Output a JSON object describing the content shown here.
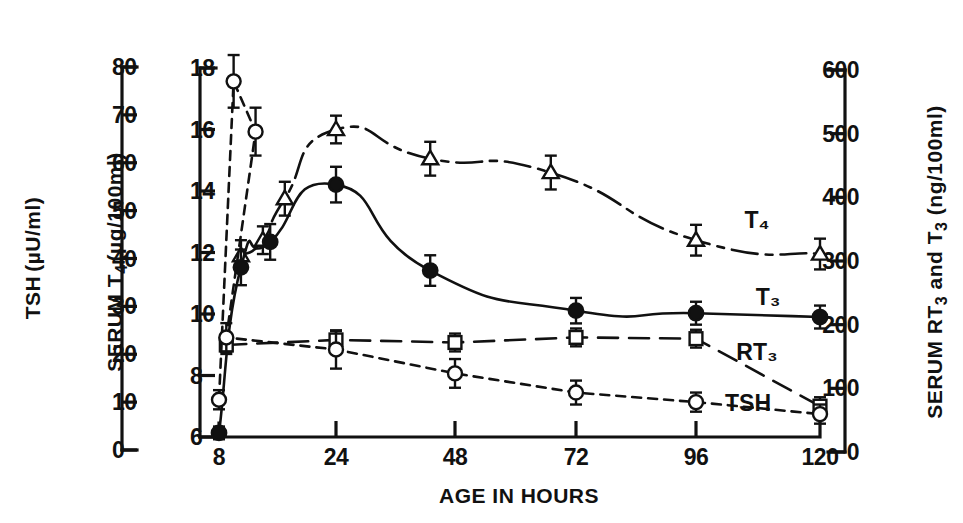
{
  "figure": {
    "background": "#ffffff",
    "ink": "#111111"
  },
  "axes": {
    "x": {
      "title": "AGE IN HOURS",
      "ticks": [
        "8",
        "24",
        "48",
        "72",
        "96",
        "120"
      ],
      "values": [
        8,
        24,
        48,
        72,
        96,
        120
      ]
    },
    "y_far_left": {
      "title_main": "TSH",
      "title_units": "(µU/ml)",
      "ticks": [
        "0",
        "10",
        "20",
        "30",
        "40",
        "50",
        "60",
        "70",
        "80"
      ],
      "values": [
        0,
        10,
        20,
        30,
        40,
        50,
        60,
        70,
        80
      ]
    },
    "y_left": {
      "title_main": "SERUM T",
      "title_sub": "4",
      "title_units": "(µg/100ml)",
      "ticks": [
        "6",
        "8",
        "10",
        "12",
        "14",
        "16",
        "18"
      ],
      "values": [
        6,
        8,
        10,
        12,
        14,
        16,
        18
      ]
    },
    "y_right": {
      "title_main": "SERUM RT",
      "title_sub1": "3",
      "title_mid": " and T",
      "title_sub2": "3",
      "title_units": " (ng/100ml)",
      "ticks": [
        "0",
        "100",
        "200",
        "300",
        "400",
        "500",
        "600"
      ],
      "values": [
        0,
        100,
        200,
        300,
        400,
        500,
        600
      ]
    }
  },
  "chart_data": {
    "type": "line",
    "title": "",
    "xlabel": "AGE IN HOURS",
    "ylabel": "SERUM T4 (µg/100ml) / TSH (µU/ml) / SERUM RT3 and T3 (ng/100ml)",
    "xlim": [
      8,
      120
    ],
    "xticks": [
      8,
      24,
      48,
      72,
      96,
      120
    ],
    "grid": false,
    "legend": "inline-right-end",
    "axis_note": "x spacing 8-24 equals spacing 24-48 (compressed early interval)",
    "series": [
      {
        "name": "T4",
        "label": "T₄",
        "marker": "open-triangle",
        "line": "dash-dot",
        "axis": "y_left",
        "units": "µg/100ml",
        "points": [
          {
            "x": 11,
            "y": 11.9,
            "err": 0.5
          },
          {
            "x": 14,
            "y": 12.4,
            "err": 0.45
          },
          {
            "x": 17,
            "y": 13.75,
            "err": 0.55
          },
          {
            "x": 24,
            "y": 16.0,
            "err": 0.45
          },
          {
            "x": 43,
            "y": 15.05,
            "err": 0.55
          },
          {
            "x": 67,
            "y": 14.6,
            "err": 0.55
          },
          {
            "x": 96,
            "y": 12.4,
            "err": 0.5
          },
          {
            "x": 120,
            "y": 11.95,
            "err": 0.5
          }
        ]
      },
      {
        "name": "T3",
        "label": "T₃",
        "marker": "filled-circle",
        "line": "solid",
        "axis": "y_right",
        "units": "ng/100ml",
        "points": [
          {
            "x": 8,
            "y": 30,
            "err": 10
          },
          {
            "x": 11,
            "y": 290,
            "err": 28
          },
          {
            "x": 15,
            "y": 330,
            "err": 28
          },
          {
            "x": 24,
            "y": 420,
            "err": 28
          },
          {
            "x": 43,
            "y": 285,
            "err": 24
          },
          {
            "x": 72,
            "y": 222,
            "err": 20
          },
          {
            "x": 96,
            "y": 218,
            "err": 18
          },
          {
            "x": 120,
            "y": 212,
            "err": 18
          }
        ]
      },
      {
        "name": "RT3",
        "label": "RT₃",
        "marker": "open-square",
        "line": "long-dash",
        "axis": "y_right",
        "units": "ng/100ml",
        "points": [
          {
            "x": 9,
            "y": 168,
            "err": 14
          },
          {
            "x": 24,
            "y": 176,
            "err": 14
          },
          {
            "x": 48,
            "y": 172,
            "err": 14
          },
          {
            "x": 72,
            "y": 180,
            "err": 14
          },
          {
            "x": 96,
            "y": 178,
            "err": 14
          },
          {
            "x": 120,
            "y": 72,
            "err": 14
          }
        ]
      },
      {
        "name": "TSH",
        "label": "TSH",
        "marker": "open-circle",
        "line": "short-dash",
        "axis": "y_far_left",
        "units": "µU/ml",
        "points": [
          {
            "x": 8,
            "y": 10.5,
            "err": 2.0
          },
          {
            "x": 10,
            "y": 77.0,
            "err": 5.5
          },
          {
            "x": 13,
            "y": 66.5,
            "err": 5.0
          },
          {
            "x": 9,
            "y": 23.5,
            "err": 3.0
          },
          {
            "x": 24,
            "y": 21.0,
            "err": 4.0
          },
          {
            "x": 48,
            "y": 16.0,
            "err": 3.0
          },
          {
            "x": 72,
            "y": 12.0,
            "err": 2.5
          },
          {
            "x": 96,
            "y": 10.0,
            "err": 2.0
          },
          {
            "x": 120,
            "y": 7.5,
            "err": 2.0
          }
        ]
      }
    ]
  }
}
